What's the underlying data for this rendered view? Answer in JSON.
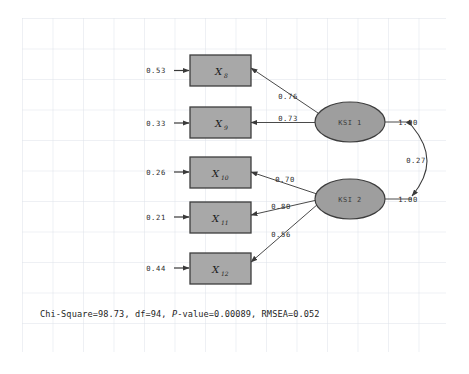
{
  "figure": {
    "type": "sem-path-diagram",
    "background_color": "#ffffff",
    "grid_color": "#dfe3ea",
    "box_fill": "#a8a8a8",
    "box_stroke": "#3d3d3d",
    "ellipse_fill": "#9e9e9e",
    "ellipse_stroke": "#3d3d3d",
    "line_color": "#4a4a4a"
  },
  "indicators": [
    {
      "id": "x8",
      "label": "X",
      "subscript": "8",
      "error": "0.53"
    },
    {
      "id": "x9",
      "label": "X",
      "subscript": "9",
      "error": "0.33"
    },
    {
      "id": "x10",
      "label": "X",
      "subscript": "10",
      "error": "0.26"
    },
    {
      "id": "x11",
      "label": "X",
      "subscript": "11",
      "error": "0.21"
    },
    {
      "id": "x12",
      "label": "X",
      "subscript": "12",
      "error": "0.44"
    }
  ],
  "latents": [
    {
      "id": "ksi1",
      "label": "KSI 1",
      "variance": "1.00"
    },
    {
      "id": "ksi2",
      "label": "KSI 2",
      "variance": "1.00"
    }
  ],
  "loadings": [
    {
      "from": "ksi1",
      "to": "x8",
      "value": "0.76"
    },
    {
      "from": "ksi1",
      "to": "x9",
      "value": "0.73"
    },
    {
      "from": "ksi2",
      "to": "x10",
      "value": "0.70"
    },
    {
      "from": "ksi2",
      "to": "x11",
      "value": "0.80"
    },
    {
      "from": "ksi2",
      "to": "x12",
      "value": "0.56"
    }
  ],
  "covariance": {
    "between": [
      "ksi1",
      "ksi2"
    ],
    "value": "0.27"
  },
  "fit_statistics": {
    "chi_square_label": "Chi-Square=",
    "chi_square_value": "98.73",
    "df_label": "df=",
    "df_value": "94",
    "p_label": "P",
    "p_label_rest": "-value=",
    "p_value": "0.00089",
    "rmsea_label": "RMSEA=",
    "rmsea_value": "0.052",
    "full_text": "Chi-Square=98.73, df=94, P-value=0.00089, RMSEA=0.052"
  }
}
